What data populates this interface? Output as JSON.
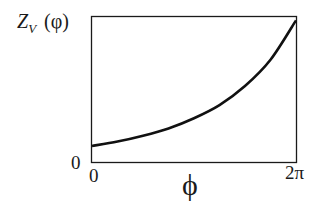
{
  "chart_data": {
    "type": "line",
    "title": "",
    "xlabel": "ϕ",
    "ylabel_main": "Z",
    "ylabel_sub": "V",
    "ylabel_arg": "(φ)",
    "x_ticks": [
      "0",
      "2π"
    ],
    "y_ticks": [
      "0"
    ],
    "xlim": [
      0,
      6.2832
    ],
    "ylim": [
      0,
      1
    ],
    "grid": false,
    "legend": null,
    "series": [
      {
        "name": "Z_V(φ)",
        "x": [
          0,
          0.785,
          1.571,
          2.356,
          3.1416,
          3.927,
          4.712,
          5.498,
          6.2832
        ],
        "y": [
          0.11,
          0.14,
          0.18,
          0.23,
          0.3,
          0.39,
          0.52,
          0.7,
          0.97
        ]
      }
    ]
  },
  "colors": {
    "axis": "#1a1a1a",
    "line": "#111111",
    "background": "#ffffff"
  }
}
